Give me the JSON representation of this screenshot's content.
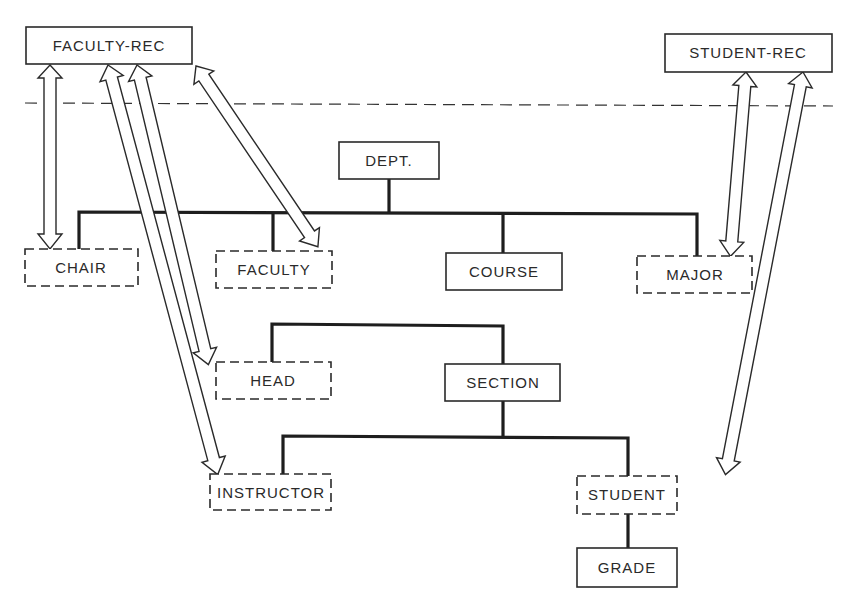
{
  "diagram": {
    "type": "hierarchical-database-schema",
    "separator": "dashed-horizontal-line",
    "nodes": {
      "faculty_rec": {
        "label": "FACULTY-REC",
        "style": "solid"
      },
      "student_rec": {
        "label": "STUDENT-REC",
        "style": "solid"
      },
      "dept": {
        "label": "DEPT.",
        "style": "solid"
      },
      "chair": {
        "label": "CHAIR",
        "style": "dashed"
      },
      "faculty": {
        "label": "FACULTY",
        "style": "dashed"
      },
      "course": {
        "label": "COURSE",
        "style": "solid"
      },
      "major": {
        "label": "MAJOR",
        "style": "dashed"
      },
      "head": {
        "label": "HEAD",
        "style": "dashed"
      },
      "section": {
        "label": "SECTION",
        "style": "solid"
      },
      "instructor": {
        "label": "INSTRUCTOR",
        "style": "dashed"
      },
      "student": {
        "label": "STUDENT",
        "style": "dashed"
      },
      "grade": {
        "label": "GRADE",
        "style": "solid"
      }
    },
    "hierarchy": [
      {
        "parent": "DEPT.",
        "children": [
          "CHAIR",
          "FACULTY",
          "COURSE",
          "MAJOR"
        ]
      },
      {
        "parent": "COURSE",
        "children": [
          "HEAD",
          "SECTION"
        ]
      },
      {
        "parent": "SECTION",
        "children": [
          "INSTRUCTOR",
          "STUDENT"
        ]
      },
      {
        "parent": "STUDENT",
        "children": [
          "GRADE"
        ]
      }
    ],
    "links": [
      {
        "from": "FACULTY-REC",
        "to": "CHAIR",
        "arrow": "double-headed"
      },
      {
        "from": "FACULTY-REC",
        "to": "FACULTY",
        "arrow": "double-headed"
      },
      {
        "from": "FACULTY-REC",
        "to": "HEAD",
        "arrow": "double-headed"
      },
      {
        "from": "FACULTY-REC",
        "to": "INSTRUCTOR",
        "arrow": "double-headed"
      },
      {
        "from": "STUDENT-REC",
        "to": "MAJOR",
        "arrow": "double-headed"
      },
      {
        "from": "STUDENT-REC",
        "to": "STUDENT",
        "arrow": "double-headed"
      }
    ],
    "colors": {
      "ink": "#2a2a2a",
      "background": "#ffffff"
    }
  }
}
